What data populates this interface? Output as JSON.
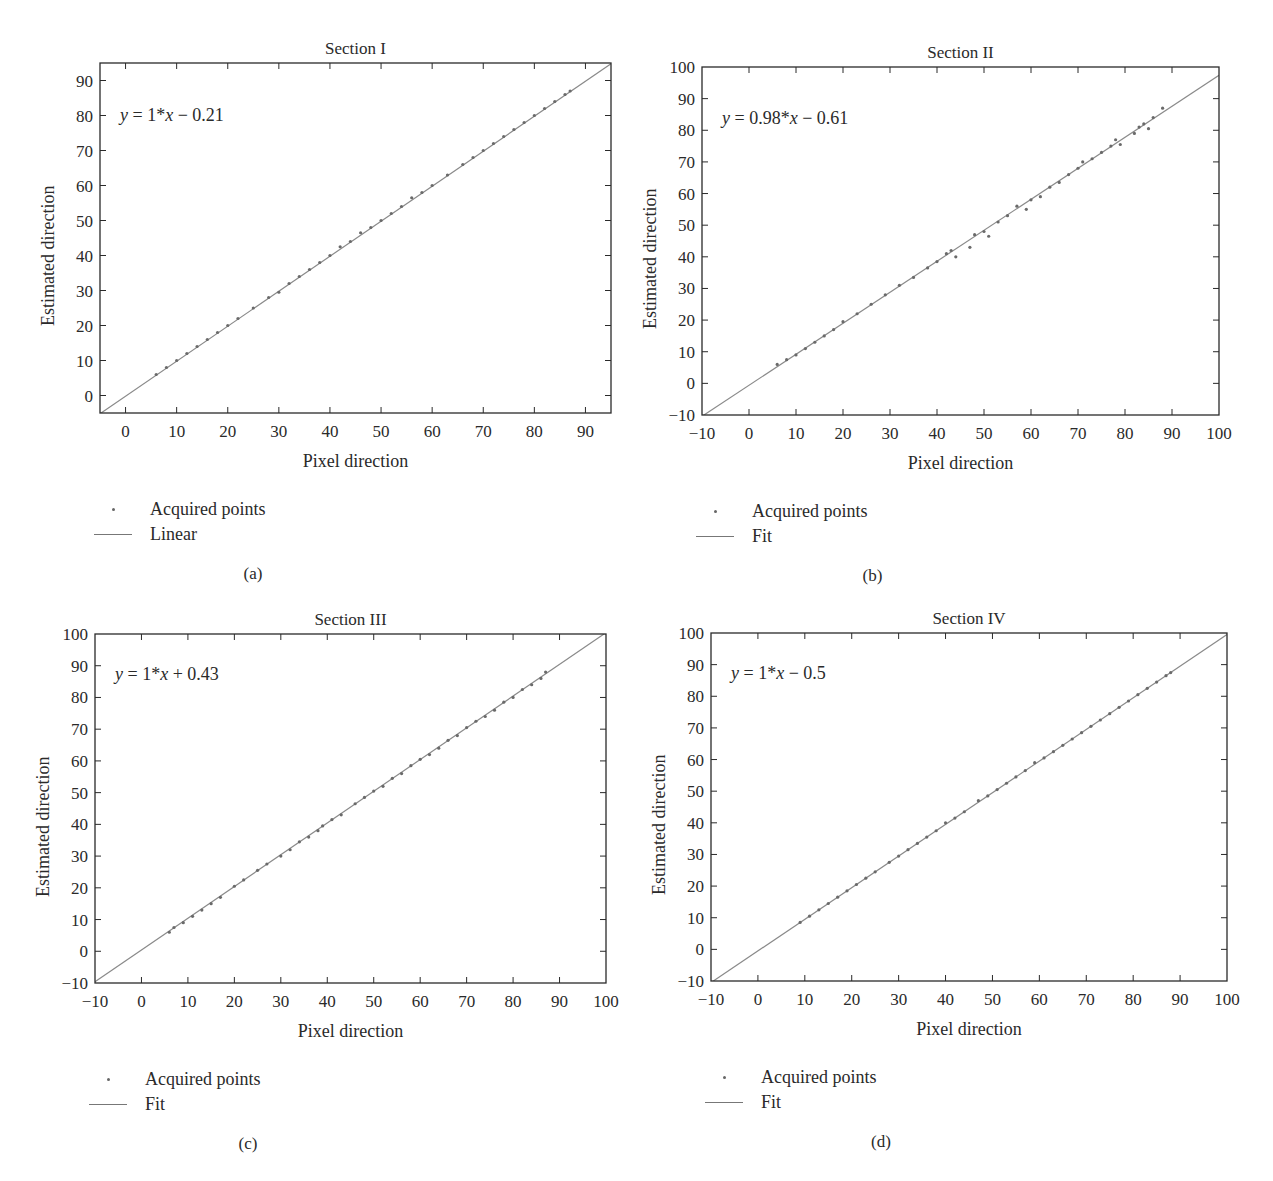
{
  "colors": {
    "axis": "#2a2a2a",
    "fit_line": "#8a8a8a",
    "points": "#6a6a6a",
    "background": "#ffffff"
  },
  "panels": [
    {
      "tag": "(a)",
      "title": "Section I",
      "equation": {
        "lhs": "y",
        "rhs_pre": " = 1*",
        "var": "x",
        "rhs_post": " − 0.21"
      },
      "xlabel": "Pixel direction",
      "ylabel": "Estimated direction",
      "legend": [
        {
          "symbol": "dot",
          "label": "Acquired points"
        },
        {
          "symbol": "line",
          "label": "Linear"
        }
      ]
    },
    {
      "tag": "(b)",
      "title": "Section II",
      "equation": {
        "lhs": "y",
        "rhs_pre": " = 0.98*",
        "var": "x",
        "rhs_post": " − 0.61"
      },
      "xlabel": "Pixel direction",
      "ylabel": "Estimated direction",
      "legend": [
        {
          "symbol": "dot",
          "label": "Acquired points"
        },
        {
          "symbol": "line",
          "label": "Fit"
        }
      ]
    },
    {
      "tag": "(c)",
      "title": "Section III",
      "equation": {
        "lhs": "y",
        "rhs_pre": " = 1*",
        "var": "x",
        "rhs_post": " + 0.43"
      },
      "xlabel": "Pixel direction",
      "ylabel": "Estimated direction",
      "legend": [
        {
          "symbol": "dot",
          "label": "Acquired points"
        },
        {
          "symbol": "line",
          "label": "Fit"
        }
      ]
    },
    {
      "tag": "(d)",
      "title": "Section IV",
      "equation": {
        "lhs": "y",
        "rhs_pre": " = 1*",
        "var": "x",
        "rhs_post": " − 0.5"
      },
      "xlabel": "Pixel direction",
      "ylabel": "Estimated direction",
      "legend": [
        {
          "symbol": "dot",
          "label": "Acquired points"
        },
        {
          "symbol": "line",
          "label": "Fit"
        }
      ]
    }
  ],
  "chart_data": [
    {
      "type": "scatter",
      "title": "Section I",
      "xlabel": "Pixel direction",
      "ylabel": "Estimated direction",
      "xlim": [
        -5,
        95
      ],
      "ylim": [
        -5,
        95
      ],
      "xticks": [
        0,
        10,
        20,
        30,
        40,
        50,
        60,
        70,
        80,
        90
      ],
      "yticks": [
        0,
        10,
        20,
        30,
        40,
        50,
        60,
        70,
        80,
        90
      ],
      "grid": false,
      "legend": [
        "Acquired points",
        "Linear"
      ],
      "legend_position": "below",
      "annotation": "y = 1*x − 0.21",
      "fit": {
        "slope": 1,
        "intercept": -0.21
      },
      "points_x_range": [
        6,
        87
      ],
      "series": [
        {
          "name": "Acquired points",
          "kind": "scatter",
          "x": [
            6,
            8,
            10,
            12,
            14,
            16,
            18,
            20,
            22,
            25,
            28,
            30,
            32,
            34,
            36,
            38,
            40,
            42,
            44,
            46,
            48,
            50,
            52,
            54,
            56,
            58,
            60,
            63,
            66,
            68,
            70,
            72,
            74,
            76,
            78,
            80,
            82,
            84,
            86,
            87
          ],
          "y": [
            6,
            8,
            10,
            12,
            14,
            16,
            18,
            20,
            22,
            25,
            28,
            29.5,
            32,
            34,
            36,
            38,
            40,
            42.5,
            44,
            46.5,
            48,
            50,
            52,
            54,
            56.5,
            58,
            60,
            63,
            66,
            68,
            70,
            72,
            74,
            76,
            78,
            80,
            82,
            84,
            86,
            87
          ]
        },
        {
          "name": "Linear",
          "kind": "line",
          "x": [
            -5,
            95
          ],
          "y": [
            -5.21,
            94.79
          ]
        }
      ]
    },
    {
      "type": "scatter",
      "title": "Section II",
      "xlabel": "Pixel direction",
      "ylabel": "Estimated direction",
      "xlim": [
        -10,
        100
      ],
      "ylim": [
        -10,
        100
      ],
      "xticks": [
        -10,
        0,
        10,
        20,
        30,
        40,
        50,
        60,
        70,
        80,
        90,
        100
      ],
      "yticks": [
        -10,
        0,
        10,
        20,
        30,
        40,
        50,
        60,
        70,
        80,
        90,
        100
      ],
      "grid": false,
      "legend": [
        "Acquired points",
        "Fit"
      ],
      "legend_position": "below",
      "annotation": "y = 0.98*x − 0.61",
      "fit": {
        "slope": 0.98,
        "intercept": -0.61
      },
      "points_x_range": [
        6,
        88
      ],
      "series": [
        {
          "name": "Acquired points",
          "kind": "scatter",
          "x": [
            6,
            8,
            10,
            12,
            14,
            16,
            18,
            20,
            23,
            26,
            29,
            32,
            35,
            38,
            40,
            42,
            43,
            44,
            47,
            48,
            50,
            51,
            53,
            55,
            57,
            59,
            60,
            62,
            64,
            66,
            68,
            70,
            71,
            73,
            75,
            77,
            78,
            79,
            82,
            83,
            84,
            85,
            86,
            88
          ],
          "y": [
            6,
            7.5,
            9,
            11,
            13,
            15,
            17,
            19.5,
            22,
            25,
            28,
            31,
            33.5,
            36.5,
            38.5,
            41,
            42,
            40,
            43,
            47,
            48,
            46.5,
            51,
            53,
            56,
            55,
            58,
            59,
            62,
            63.5,
            66,
            68,
            70,
            71,
            73,
            75,
            77,
            75.5,
            79,
            81,
            82,
            80.5,
            84,
            87
          ]
        },
        {
          "name": "Fit",
          "kind": "line",
          "x": [
            -10,
            100
          ],
          "y": [
            -10.41,
            97.39
          ]
        }
      ]
    },
    {
      "type": "scatter",
      "title": "Section III",
      "xlabel": "Pixel direction",
      "ylabel": "Estimated direction",
      "xlim": [
        -10,
        100
      ],
      "ylim": [
        -10,
        100
      ],
      "xticks": [
        -10,
        0,
        10,
        20,
        30,
        40,
        50,
        60,
        70,
        80,
        90,
        100
      ],
      "yticks": [
        -10,
        0,
        10,
        20,
        30,
        40,
        50,
        60,
        70,
        80,
        90,
        100
      ],
      "grid": false,
      "legend": [
        "Acquired points",
        "Fit"
      ],
      "legend_position": "below",
      "annotation": "y = 1*x + 0.43",
      "fit": {
        "slope": 1,
        "intercept": 0.43
      },
      "points_x_range": [
        6,
        87
      ],
      "series": [
        {
          "name": "Acquired points",
          "kind": "scatter",
          "x": [
            6,
            7,
            9,
            11,
            13,
            15,
            17,
            20,
            22,
            25,
            27,
            30,
            32,
            34,
            36,
            38,
            39,
            41,
            43,
            46,
            48,
            50,
            52,
            54,
            56,
            58,
            60,
            62,
            64,
            66,
            68,
            70,
            72,
            74,
            76,
            78,
            80,
            82,
            84,
            86,
            87
          ],
          "y": [
            6,
            7.5,
            9,
            11,
            13,
            15,
            17,
            20.5,
            22.5,
            25.5,
            27.5,
            30,
            32,
            34.5,
            36,
            38,
            39.5,
            41.5,
            43,
            46.5,
            48.5,
            50.5,
            52,
            54.5,
            56,
            58.5,
            60.5,
            62,
            64,
            66.5,
            68,
            70.5,
            72.5,
            74,
            76,
            78.5,
            80,
            82.5,
            84,
            86,
            88
          ]
        },
        {
          "name": "Fit",
          "kind": "line",
          "x": [
            -10,
            100
          ],
          "y": [
            -9.57,
            100.43
          ]
        }
      ]
    },
    {
      "type": "scatter",
      "title": "Section IV",
      "xlabel": "Pixel direction",
      "ylabel": "Estimated direction",
      "xlim": [
        -10,
        100
      ],
      "ylim": [
        -10,
        100
      ],
      "xticks": [
        -10,
        0,
        10,
        20,
        30,
        40,
        50,
        60,
        70,
        80,
        90,
        100
      ],
      "yticks": [
        -10,
        0,
        10,
        20,
        30,
        40,
        50,
        60,
        70,
        80,
        90,
        100
      ],
      "grid": false,
      "legend": [
        "Acquired points",
        "Fit"
      ],
      "legend_position": "below",
      "annotation": "y = 1*x − 0.5",
      "fit": {
        "slope": 1,
        "intercept": -0.5
      },
      "points_x_range": [
        9,
        88
      ],
      "series": [
        {
          "name": "Acquired points",
          "kind": "scatter",
          "x": [
            9,
            11,
            13,
            15,
            17,
            19,
            21,
            23,
            25,
            28,
            30,
            32,
            34,
            36,
            38,
            40,
            42,
            44,
            47,
            49,
            51,
            53,
            55,
            57,
            59,
            61,
            63,
            65,
            67,
            69,
            71,
            73,
            75,
            77,
            79,
            81,
            83,
            85,
            87,
            88
          ],
          "y": [
            8.5,
            10.5,
            12.5,
            14.5,
            16.5,
            18.5,
            20.5,
            22.5,
            24.5,
            27.5,
            29.5,
            31.5,
            33.5,
            35.5,
            37.5,
            40,
            41.5,
            43.5,
            47,
            48.5,
            50.5,
            52.5,
            54.5,
            56.5,
            59,
            60.5,
            62.5,
            64.5,
            66.5,
            68.5,
            70.5,
            72.5,
            74.5,
            76.5,
            78.5,
            80.5,
            82.5,
            84.5,
            86.5,
            87.5
          ]
        },
        {
          "name": "Fit",
          "kind": "line",
          "x": [
            -10,
            100
          ],
          "y": [
            -10.5,
            99.5
          ]
        }
      ]
    }
  ]
}
